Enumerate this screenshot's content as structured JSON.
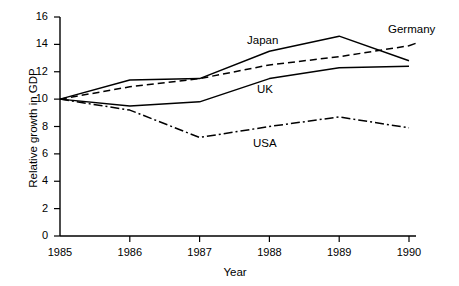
{
  "chart_data": {
    "type": "line",
    "title": "",
    "xlabel": "Year",
    "ylabel": "Relative growth in GDP",
    "x": [
      1985,
      1986,
      1987,
      1988,
      1989,
      1990
    ],
    "xtick_labels": [
      "1985",
      "1986",
      "1987",
      "1988",
      "1989",
      "1990"
    ],
    "ytick_labels": [
      "0",
      "2",
      "4",
      "6",
      "8",
      "10",
      "12",
      "14",
      "16"
    ],
    "ytick_values": [
      0,
      2,
      4,
      6,
      8,
      10,
      12,
      14,
      16
    ],
    "xlim": [
      1985,
      1990
    ],
    "ylim": [
      0,
      16
    ],
    "grid": false,
    "legend_position": "inline-annotations",
    "series": [
      {
        "name": "Japan",
        "style": "solid",
        "color": "#000000",
        "values": [
          10.0,
          11.4,
          11.5,
          13.5,
          14.6,
          12.8
        ]
      },
      {
        "name": "Germany",
        "style": "dashed",
        "color": "#000000",
        "values": [
          10.0,
          10.9,
          11.5,
          12.5,
          13.1,
          13.9
        ]
      },
      {
        "name": "UK",
        "style": "solid",
        "color": "#000000",
        "values": [
          10.0,
          9.5,
          9.8,
          11.5,
          12.3,
          12.4
        ]
      },
      {
        "name": "USA",
        "style": "dash-dot",
        "color": "#000000",
        "values": [
          10.0,
          9.2,
          7.2,
          8.0,
          8.7,
          7.9
        ]
      }
    ],
    "annotations": [
      {
        "text": "Japan",
        "series": "Japan"
      },
      {
        "text": "Germany",
        "series": "Germany"
      },
      {
        "text": "UK",
        "series": "UK"
      },
      {
        "text": "USA",
        "series": "USA"
      }
    ]
  },
  "axes": {
    "x_title": "Year",
    "y_title": "Relative growth in GDP"
  }
}
